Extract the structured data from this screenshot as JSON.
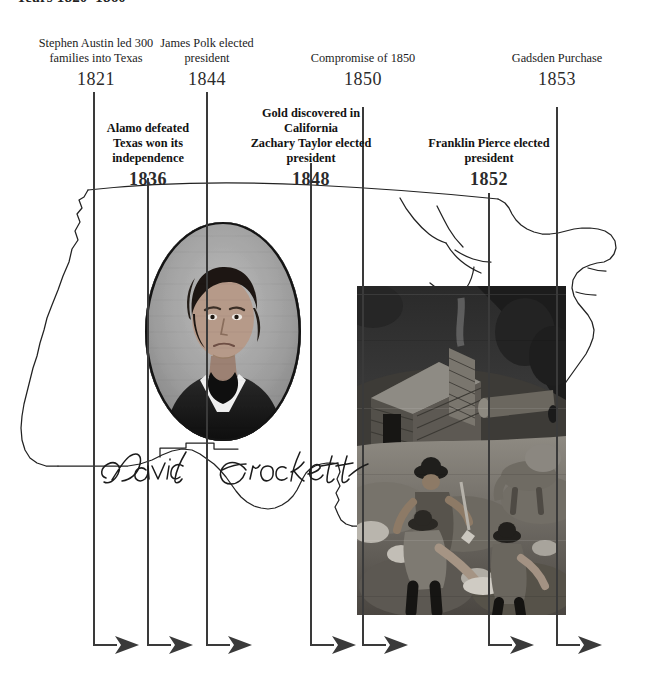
{
  "title": "Years 1820–1860",
  "timeline": {
    "events_top": [
      {
        "id": "1821",
        "text": "Stephen Austin led 300 families into Texas",
        "year": "1821",
        "x": 94
      },
      {
        "id": "1844",
        "text": "James Polk elected president",
        "year": "1844",
        "x": 207
      },
      {
        "id": "1850",
        "text": "Compromise of 1850",
        "year": "1850",
        "x": 363
      },
      {
        "id": "1853",
        "text": "Gadsden Purchase",
        "year": "1853",
        "x": 557
      }
    ],
    "events_bottom": [
      {
        "id": "1836",
        "text": "Alamo defeated Texas won its independence",
        "year": "1836",
        "x": 148
      },
      {
        "id": "1848",
        "text": "Gold discovered in California Zachary Taylor elected president",
        "year": "1848",
        "x": 311
      },
      {
        "id": "1852",
        "text": "Franklin Pierce elected president",
        "year": "1852",
        "x": 489
      }
    ],
    "arrow_baseline_y": 645,
    "line_color": "#3a3a3a"
  },
  "labels": {
    "l1821_line1": "Stephen Austin led 300",
    "l1821_line2": "families into Texas",
    "l1821_year": "1821",
    "l1844_line1": "James Polk elected",
    "l1844_line2": "president",
    "l1844_year": "1844",
    "l1850_line1": "Compromise of 1850",
    "l1850_year": "1850",
    "l1853_line1": "Gadsden Purchase",
    "l1853_year": "1853",
    "l1836_line1": "Alamo defeated",
    "l1836_line2": "Texas won its",
    "l1836_line3": "independence",
    "l1836_year": "1836",
    "l1848_line1": "Gold discovered in",
    "l1848_line2": "California",
    "l1848_line3": "Zachary Taylor elected",
    "l1848_line4": "president",
    "l1848_year": "1848",
    "l1852_line1": "Franklin Pierce elected",
    "l1852_line2": "president",
    "l1852_year": "1852"
  },
  "images": {
    "portrait_subject": "David Crockett",
    "portrait_signature": "David Crockett",
    "photo_caption": "California gold rush miners panning near a log cabin"
  },
  "colors": {
    "line": "#3a3a3a",
    "map_outline": "#222222",
    "text": "#1a1a1a",
    "background": "#ffffff"
  }
}
